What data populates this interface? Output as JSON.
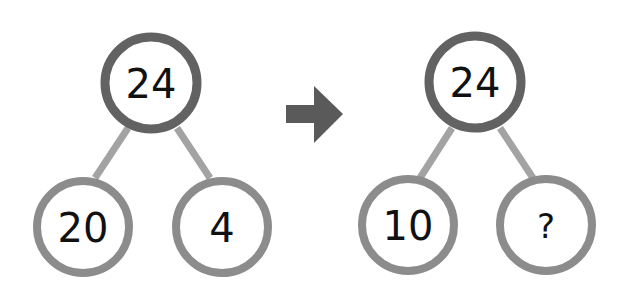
{
  "diagram": {
    "type": "number-bond",
    "colors": {
      "top_circle_border": "#626262",
      "bottom_circle_border": "#8c8c8c",
      "connector": "#a3a3a3",
      "arrow": "#5a5a5a",
      "text": "#111111"
    },
    "left_bond": {
      "whole": "24",
      "parts": [
        "20",
        "4"
      ]
    },
    "arrow": {
      "icon": "right-arrow-icon"
    },
    "right_bond": {
      "whole": "24",
      "parts": [
        "10",
        "?"
      ]
    }
  }
}
